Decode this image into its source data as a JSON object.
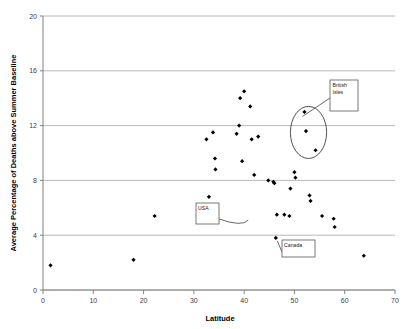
{
  "chart_data": {
    "type": "scatter",
    "title": "",
    "xlabel": "Latitude",
    "ylabel": "Average Percentage of Deaths above Summer Baseline",
    "xlim": [
      0,
      70
    ],
    "ylim": [
      0,
      20
    ],
    "xticks": [
      "0",
      "10",
      "20",
      "30",
      "40",
      "50",
      "60",
      "70"
    ],
    "xtick_values": [
      0,
      10,
      20,
      30,
      40,
      50,
      60,
      70
    ],
    "yticks": [
      "0",
      "4",
      "8",
      "12",
      "16",
      "20"
    ],
    "ytick_values": [
      0,
      4,
      8,
      12,
      16,
      20
    ],
    "grid": "horizontal",
    "legend": "none",
    "marker": "filled-diamond",
    "marker_color": "#000000",
    "points": [
      {
        "x": 1.5,
        "y": 1.8
      },
      {
        "x": 18.0,
        "y": 2.2
      },
      {
        "x": 22.2,
        "y": 5.4
      },
      {
        "x": 32.5,
        "y": 11.0
      },
      {
        "x": 33.8,
        "y": 11.5
      },
      {
        "x": 34.2,
        "y": 9.6
      },
      {
        "x": 34.3,
        "y": 8.8
      },
      {
        "x": 33.0,
        "y": 6.8
      },
      {
        "x": 38.5,
        "y": 11.4
      },
      {
        "x": 39.0,
        "y": 12.0
      },
      {
        "x": 39.2,
        "y": 14.0
      },
      {
        "x": 40.0,
        "y": 14.5
      },
      {
        "x": 41.2,
        "y": 13.4
      },
      {
        "x": 39.6,
        "y": 9.4
      },
      {
        "x": 41.5,
        "y": 11.0
      },
      {
        "x": 42.8,
        "y": 11.2
      },
      {
        "x": 42.0,
        "y": 8.4
      },
      {
        "x": 44.8,
        "y": 8.0
      },
      {
        "x": 45.8,
        "y": 7.9
      },
      {
        "x": 46.0,
        "y": 7.8
      },
      {
        "x": 46.5,
        "y": 5.5
      },
      {
        "x": 48.0,
        "y": 5.5
      },
      {
        "x": 49.0,
        "y": 5.4
      },
      {
        "x": 49.2,
        "y": 7.4
      },
      {
        "x": 50.0,
        "y": 8.6
      },
      {
        "x": 50.2,
        "y": 8.2
      },
      {
        "x": 46.3,
        "y": 3.8
      },
      {
        "x": 52.0,
        "y": 13.0
      },
      {
        "x": 52.3,
        "y": 11.6
      },
      {
        "x": 54.2,
        "y": 10.2
      },
      {
        "x": 53.0,
        "y": 6.9
      },
      {
        "x": 53.2,
        "y": 6.5
      },
      {
        "x": 55.5,
        "y": 5.4
      },
      {
        "x": 57.8,
        "y": 5.2
      },
      {
        "x": 58.0,
        "y": 4.6
      },
      {
        "x": 63.8,
        "y": 2.5
      }
    ],
    "annotations": [
      {
        "id": "british-isles",
        "label_line_1": "British",
        "label_line_2": "Isles",
        "type": "ellipse-callout",
        "ellipse": {
          "cx": 52.8,
          "cy": 11.5,
          "rx": 3.6,
          "ry": 1.9
        }
      },
      {
        "id": "usa",
        "label_line_1": "USA",
        "label_line_2": "",
        "type": "box-callout",
        "target": {
          "x": 41.2,
          "y": 5.1
        }
      },
      {
        "id": "canada",
        "label_line_1": "Canada",
        "label_line_2": "",
        "type": "box-callout",
        "target": {
          "x": 46.3,
          "y": 3.8
        }
      }
    ]
  }
}
